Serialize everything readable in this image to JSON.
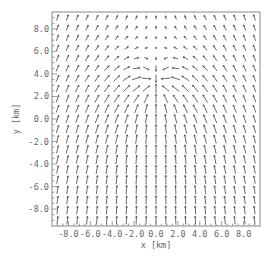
{
  "chart_data": {
    "type": "quiver",
    "title": "",
    "xlabel": "x [km]",
    "ylabel": "y [km]",
    "xlim": [
      -9.5,
      9.5
    ],
    "ylim": [
      -9.5,
      9.5
    ],
    "xticks": [
      -8.0,
      -6.0,
      -4.0,
      -2.0,
      0.0,
      2.0,
      4.0,
      6.0,
      8.0
    ],
    "xtick_labels": [
      "-8.0",
      "-6.0",
      "-4.0",
      "-2.0",
      "0.0",
      "2.0",
      "4.0",
      "6.0",
      "8.0"
    ],
    "yticks": [
      -8.0,
      -6.0,
      -4.0,
      -2.0,
      0.0,
      2.0,
      4.0,
      6.0,
      8.0
    ],
    "ytick_labels": [
      "-8.0",
      "-6.0",
      "-4.0",
      "-2.0",
      "0.0",
      "2.0",
      "4.0",
      "6.0",
      "8.0"
    ],
    "grid": false,
    "legend": null,
    "field": {
      "description": "Uniform upward (+y) background flow superposed with a point sink near (0, 3) km; vectors converge toward the sink from left and right, flow weakens above it",
      "grid_x": {
        "start": -9.0,
        "stop": 9.0,
        "step": 0.9
      },
      "grid_y": {
        "start": -9.0,
        "stop": 9.0,
        "step": 0.9
      },
      "background_flow": [
        0.0,
        1.0
      ],
      "sink_center": [
        0.0,
        3.0
      ],
      "sink_strength": 3.5,
      "arrow_scale_px": 8
    }
  },
  "plot": {
    "frame_color": "#888888",
    "arrow_color": "#444444",
    "text_color": "#666666"
  }
}
